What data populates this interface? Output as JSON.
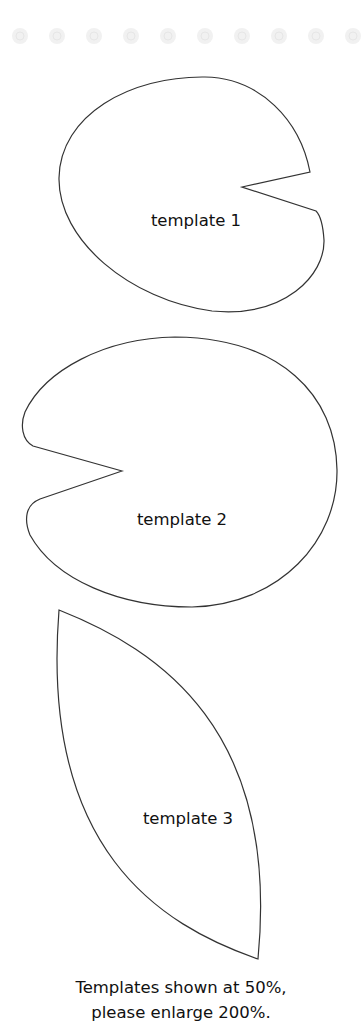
{
  "decoration": {
    "border_dots": 10,
    "dot_icon": "flower-dot-icon",
    "dot_color": "#f1f1f1"
  },
  "templates": [
    {
      "label": "template 1",
      "shape": "lily-pad-notch-right"
    },
    {
      "label": "template 2",
      "shape": "lily-pad-notch-left"
    },
    {
      "label": "template 3",
      "shape": "petal-leaf"
    }
  ],
  "caption": {
    "line1": "Templates shown at 50%,",
    "line2": "please enlarge 200%."
  },
  "colors": {
    "outline": "#333333",
    "text": "#111111",
    "background": "#ffffff"
  }
}
